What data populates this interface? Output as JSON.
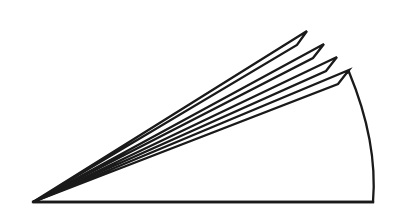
{
  "figure": {
    "type": "line-drawing",
    "width": 396,
    "height": 217,
    "background_color": "#ffffff",
    "stroke_color": "#1a1a1a",
    "hatch_color": "#1a1a1a",
    "fill_color": "#ffffff",
    "outline_stroke_width": 2.3,
    "hatch_stroke_width": 1.0,
    "apex": {
      "x": 33,
      "y": 202
    },
    "baseline": {
      "name": "bottom-edge",
      "x1": 33,
      "y1": 202,
      "x2": 373,
      "y2": 202
    },
    "blades": [
      {
        "name": "blade-1-topmost",
        "tip_outer": {
          "x": 307,
          "y": 31
        },
        "tip_inner": {
          "x": 297,
          "y": 45
        },
        "path": "M33,202 L307,31 L297,45 Z",
        "hatched": false
      },
      {
        "name": "blade-2",
        "tip_outer": {
          "x": 324,
          "y": 44
        },
        "tip_inner": {
          "x": 313,
          "y": 58
        },
        "path": "M33,202 L324,44 L313,58 Z",
        "hatched": false
      },
      {
        "name": "blade-3",
        "tip_outer": {
          "x": 337,
          "y": 57
        },
        "tip_inner": {
          "x": 326,
          "y": 71
        },
        "path": "M33,202 L337,57 L326,71 Z",
        "hatched": false
      },
      {
        "name": "blade-4",
        "tip_outer": {
          "x": 349,
          "y": 70
        },
        "tip_inner": {
          "x": 338,
          "y": 84
        },
        "path": "M33,202 L349,70 L338,84 Z",
        "hatched": false
      }
    ],
    "sector": {
      "name": "hatched-sector",
      "apex": {
        "x": 33,
        "y": 202
      },
      "arc_start": {
        "x": 349,
        "y": 72
      },
      "arc_end": {
        "x": 373,
        "y": 202
      },
      "arc_control": {
        "x": 378,
        "y": 140
      },
      "path": "M33,202 L349,72 Q378,142 373,202 Z",
      "hatched": true,
      "hatch_count": 9,
      "hatch_direction": "parallel-to-upper-edge"
    },
    "hatch_lines": [
      {
        "name": "hatch-line-1",
        "x1": 70,
        "y1": 202,
        "x2": 100,
        "y2": 177
      },
      {
        "name": "hatch-line-2",
        "x1": 108,
        "y1": 202,
        "x2": 166,
        "y2": 154
      },
      {
        "name": "hatch-line-3",
        "x1": 145,
        "y1": 202,
        "x2": 231,
        "y2": 131
      },
      {
        "name": "hatch-line-4",
        "x1": 183,
        "y1": 202,
        "x2": 288,
        "y2": 116
      },
      {
        "name": "hatch-line-5",
        "x1": 220,
        "y1": 202,
        "x2": 333,
        "y2": 110
      },
      {
        "name": "hatch-line-6",
        "x1": 258,
        "y1": 202,
        "x2": 360,
        "y2": 119
      },
      {
        "name": "hatch-line-7",
        "x1": 295,
        "y1": 202,
        "x2": 373,
        "y2": 139
      },
      {
        "name": "hatch-line-8",
        "x1": 333,
        "y1": 202,
        "x2": 377,
        "y2": 166
      },
      {
        "name": "hatch-line-9",
        "x1": 358,
        "y1": 202,
        "x2": 376,
        "y2": 188
      }
    ]
  }
}
